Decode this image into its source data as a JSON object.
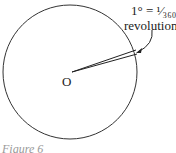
{
  "diagram": {
    "center_label": "O",
    "annotation_line1": "1° = ¹⁄₃₆₀",
    "annotation_line2": "revolution",
    "caption": "Figure 6"
  }
}
